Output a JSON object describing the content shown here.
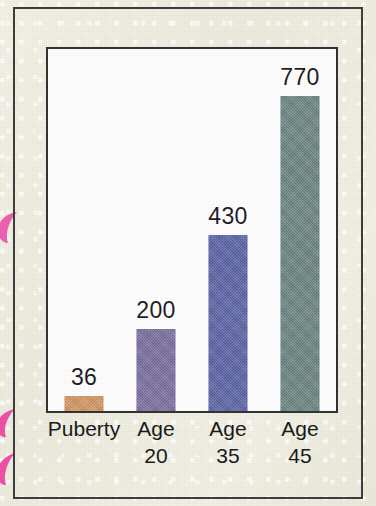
{
  "figure": {
    "background_color": "#f3f1e3",
    "frame_color": "#3a3a3c",
    "plot_background": "#ffffff",
    "plot_border_color": "#2f2f31",
    "decorations": [
      {
        "name": "pink-petal-upper",
        "color": "#ef5fb0"
      },
      {
        "name": "pink-petal-middle",
        "color": "#ef4fa8"
      },
      {
        "name": "pink-petal-lower",
        "color": "#ef4fa8"
      }
    ]
  },
  "chart_data": {
    "type": "bar",
    "title": "",
    "subtitle": "",
    "xlabel": "",
    "ylabel": "",
    "categories": [
      "Puberty",
      "Age 20",
      "Age 35",
      "Age 45"
    ],
    "category_lines": [
      [
        "Puberty",
        ""
      ],
      [
        "Age",
        "20"
      ],
      [
        "Age",
        "35"
      ],
      [
        "Age",
        "45"
      ]
    ],
    "values": [
      36,
      200,
      430,
      770
    ],
    "value_labels": [
      "36",
      "200",
      "430",
      "770"
    ],
    "colors": [
      "#d89a62",
      "#7e71a4",
      "#5d66ab",
      "#6e8884"
    ],
    "ylim": [
      0,
      885
    ],
    "grid": false,
    "legend": "none",
    "axis_visible": {
      "x": true,
      "y": true,
      "ticks": false
    }
  }
}
